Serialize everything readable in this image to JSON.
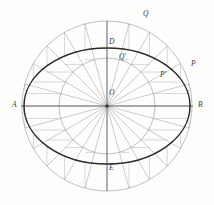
{
  "figure": {
    "background_color": "#fdfdfc",
    "center": {
      "x": 107,
      "y": 106,
      "label": "O"
    },
    "outer_circle": {
      "radius": 85,
      "stroke": "#8d8d8d",
      "width": 0.55
    },
    "inner_circle": {
      "radius": 48,
      "stroke": "#8d8d8d",
      "width": 0.55
    },
    "ellipse": {
      "rx": 83,
      "ry": 58,
      "stroke": "#2b2b2b",
      "width": 1.5
    },
    "radial_step_degrees": 15,
    "radial_stroke": "#9a9a9a",
    "construction_stroke": "#a9a9a9",
    "axis_stroke": "#4a4a4a"
  },
  "labels": [
    {
      "id": "A",
      "text": "A",
      "x": 12,
      "y": 101,
      "desc": "major-axis-left-vertex"
    },
    {
      "id": "B",
      "text": "B",
      "x": 198,
      "y": 101,
      "desc": "major-axis-right-vertex"
    },
    {
      "id": "O",
      "text": "O",
      "x": 109,
      "y": 89,
      "desc": "center"
    },
    {
      "id": "D",
      "text": "D",
      "x": 109,
      "y": 38,
      "desc": "minor-axis-top-vertex"
    },
    {
      "id": "E",
      "text": "E",
      "x": 109,
      "y": 164,
      "desc": "minor-axis-bottom-vertex"
    },
    {
      "id": "Q",
      "text": "Q",
      "x": 143,
      "y": 10,
      "desc": "outer-circle-point"
    },
    {
      "id": "Qp",
      "text": "Q'",
      "x": 119,
      "y": 53,
      "desc": "inner-circle-point"
    },
    {
      "id": "Pp",
      "text": "P'",
      "x": 160,
      "y": 71,
      "desc": "ellipse-point-inner"
    },
    {
      "id": "P",
      "text": "P",
      "x": 191,
      "y": 60,
      "desc": "ellipse-point-outer"
    }
  ]
}
